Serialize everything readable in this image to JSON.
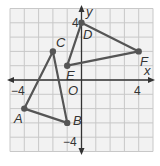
{
  "diagram": {
    "type": "coordinate-plane",
    "grid": {
      "xmin": -5,
      "xmax": 5,
      "ymin": -5,
      "ymax": 5,
      "step": 1
    },
    "axes": {
      "x_label": "x",
      "y_label": "y",
      "origin_label": "O"
    },
    "tick_labels": {
      "x_neg": "−4",
      "x_pos": "4",
      "y_pos": "4",
      "y_neg": "−4"
    },
    "points": [
      {
        "name": "A",
        "x": -4,
        "y": -2
      },
      {
        "name": "B",
        "x": -1,
        "y": -3
      },
      {
        "name": "C",
        "x": -2,
        "y": 2
      },
      {
        "name": "D",
        "x": 0,
        "y": 4
      },
      {
        "name": "E",
        "x": -1,
        "y": 1
      },
      {
        "name": "F",
        "x": 4,
        "y": 2
      }
    ],
    "triangles": [
      {
        "name": "triangle-ABC",
        "vertices": [
          "A",
          "B",
          "C"
        ]
      },
      {
        "name": "triangle-DEF",
        "vertices": [
          "D",
          "E",
          "F"
        ]
      }
    ],
    "colors": {
      "grid": "#c8c8c8",
      "axis": "#333333",
      "shape": "#555555",
      "background": "#f2f2f2"
    }
  }
}
